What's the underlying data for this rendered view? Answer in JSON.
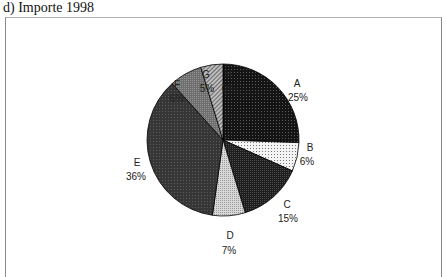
{
  "title": "d) Importe 1998",
  "chart_data": {
    "type": "pie",
    "title": "d) Importe 1998",
    "categories": [
      "A",
      "B",
      "C",
      "D",
      "E",
      "F",
      "G",
      "H"
    ],
    "values": [
      25,
      6,
      15,
      7,
      36,
      6,
      5,
      0
    ],
    "unit": "%",
    "start_angle": "12 o'clock",
    "direction": "clockwise",
    "legend": "none (labels beside slices)",
    "slices": [
      {
        "label": "A",
        "pct_label": "25%",
        "fill": "#1a1a1a",
        "pattern": "dark dotted"
      },
      {
        "label": "B",
        "pct_label": "6%",
        "fill": "#f2f2f2",
        "pattern": "light dotted"
      },
      {
        "label": "C",
        "pct_label": "15%",
        "fill": "#2a2a2a",
        "pattern": "dark stipple"
      },
      {
        "label": "D",
        "pct_label": "7%",
        "fill": "#c4c4c4",
        "pattern": "light gray stipple"
      },
      {
        "label": "E",
        "pct_label": "36%",
        "fill": "#3c3c3c",
        "pattern": "dark gray grid"
      },
      {
        "label": "F",
        "pct_label": "6%",
        "fill": "#7a7a7a",
        "pattern": "medium gray dots"
      },
      {
        "label": "G",
        "pct_label": "5%",
        "fill": "#a6a6a6",
        "pattern": "diagonal hatch"
      },
      {
        "label": "H",
        "pct_label": "0%",
        "fill": "#000000",
        "pattern": "none"
      }
    ]
  },
  "labels": {
    "A": {
      "name": "A",
      "pct": "25%"
    },
    "B": {
      "name": "B",
      "pct": "6%"
    },
    "C": {
      "name": "C",
      "pct": "15%"
    },
    "D": {
      "name": "D",
      "pct": "7%"
    },
    "E": {
      "name": "E",
      "pct": "36%"
    },
    "F": {
      "name": "F",
      "pct": "6%"
    },
    "G": {
      "name": "G",
      "pct": "5%"
    },
    "H": {
      "name": "H",
      "pct": "0%"
    }
  }
}
